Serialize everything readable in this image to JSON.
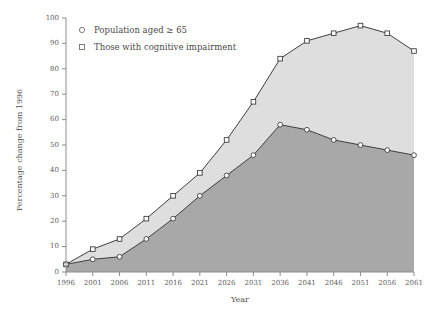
{
  "chart_data": {
    "type": "area",
    "title": "",
    "xlabel": "Year",
    "ylabel": "Percentage change from 1996",
    "x": [
      1996,
      2001,
      2006,
      2011,
      2016,
      2021,
      2026,
      2031,
      2036,
      2041,
      2046,
      2051,
      2056,
      2061
    ],
    "categories": [
      "1996",
      "2001",
      "2006",
      "2011",
      "2016",
      "2021",
      "2026",
      "2031",
      "2036",
      "2041",
      "2046",
      "2051",
      "2056",
      "2061"
    ],
    "xlim": [
      1996,
      2061
    ],
    "ylim": [
      0,
      100
    ],
    "y_ticks": [
      0,
      10,
      20,
      30,
      40,
      50,
      60,
      70,
      80,
      90,
      100
    ],
    "grid": false,
    "legend_position": "top-left",
    "series": [
      {
        "name": "Those with cognitive impairment",
        "marker": "square",
        "fill_color": "#dedede",
        "line_color": "#3f3f3f",
        "values": [
          3,
          9,
          13,
          21,
          30,
          39,
          52,
          67,
          84,
          91,
          94,
          97,
          94,
          87
        ]
      },
      {
        "name": "Population aged ≥ 65",
        "marker": "circle",
        "fill_color": "#a8a8a8",
        "line_color": "#3f3f3f",
        "values": [
          3,
          5,
          6,
          13,
          21,
          30,
          38,
          46,
          58,
          56,
          52,
          50,
          48,
          46
        ]
      }
    ]
  },
  "legend": {
    "items": [
      {
        "label": "Population aged ≥ 65",
        "marker": "circle"
      },
      {
        "label": "Those with cognitive impairment",
        "marker": "square"
      }
    ]
  },
  "axes": {
    "x_title": "Year",
    "y_title": "Percentage change from 1996"
  },
  "colors": {
    "upper_fill": "#dedede",
    "lower_fill": "#a8a8a8",
    "line": "#3f3f3f",
    "axis": "#8d8d8d",
    "text": "#4a4a4a",
    "background": "#ffffff"
  }
}
